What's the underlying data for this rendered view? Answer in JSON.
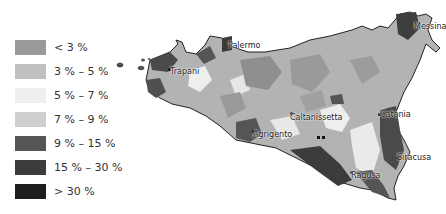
{
  "legend": {
    "items": [
      {
        "label": "< 3 %",
        "color": "#9a9a9a"
      },
      {
        "label": "3 % – 5 %",
        "color": "#c0c0c0"
      },
      {
        "label": "5 % – 7 %",
        "color": "#eeeeee"
      },
      {
        "label": "7 % – 9 %",
        "color": "#cfcfcf"
      },
      {
        "label": "9 % – 15 %",
        "color": "#555555"
      },
      {
        "label": "15 % – 30 %",
        "color": "#3c3c3c"
      },
      {
        "label": "> 30 %",
        "color": "#1e1e1e"
      }
    ]
  },
  "map": {
    "region": "Sicily",
    "cities": [
      {
        "name": "Palermo"
      },
      {
        "name": "Trapani"
      },
      {
        "name": "Messina"
      },
      {
        "name": "Caltanissetta"
      },
      {
        "name": "Catania"
      },
      {
        "name": "Agrigento"
      },
      {
        "name": "Siracusa"
      },
      {
        "name": "Ragusa"
      }
    ]
  }
}
